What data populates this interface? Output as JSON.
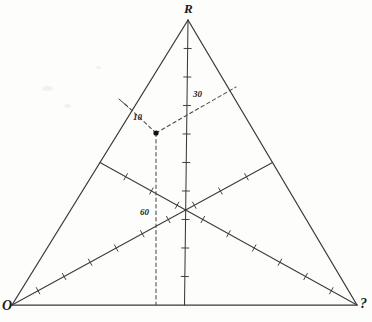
{
  "figure": {
    "type": "ternary-triangle-diagram",
    "background_color": "#fdfdfc",
    "line_color": "#3a3a3a",
    "dash_color": "#4a4a4a",
    "text_color": "#1a1a1a"
  },
  "vertices": {
    "top": {
      "label": "R",
      "x": 188,
      "y": 20,
      "label_x": 184,
      "label_y": 2
    },
    "bottom_left": {
      "label": "O",
      "x": 12,
      "y": 305,
      "label_x": 2,
      "label_y": 299
    },
    "bottom_right": {
      "label": "?",
      "x": 357,
      "y": 305,
      "label_x": 360,
      "label_y": 297
    }
  },
  "point": {
    "x": 156,
    "y": 133,
    "marker": "filled-circle"
  },
  "readings": [
    {
      "label": "10",
      "value": 10,
      "label_x": 133,
      "label_y": 113,
      "axis": "left-edge"
    },
    {
      "label": "30",
      "value": 30,
      "label_x": 193,
      "label_y": 90,
      "axis": "right-edge"
    },
    {
      "label": "60",
      "value": 60,
      "label_x": 140,
      "label_y": 208,
      "axis": "bottom-edge"
    }
  ],
  "dashed_lines": [
    {
      "name": "to-left-edge",
      "x1": 156,
      "y1": 133,
      "x2": 124,
      "y2": 103
    },
    {
      "name": "to-right-edge",
      "x1": 156,
      "y1": 133,
      "x2": 236,
      "y2": 87
    },
    {
      "name": "to-bottom-edge",
      "x1": 156,
      "y1": 133,
      "x2": 156,
      "y2": 305
    }
  ],
  "medians": [
    {
      "name": "median-from-top",
      "x1": 188,
      "y1": 20,
      "x2": 184.5,
      "y2": 305,
      "ticks": 9
    },
    {
      "name": "median-from-bottom-left",
      "x1": 12,
      "y1": 305,
      "x2": 272.5,
      "y2": 162.5,
      "ticks": 9
    },
    {
      "name": "median-from-bottom-right",
      "x1": 357,
      "y1": 305,
      "x2": 100,
      "y2": 162.5,
      "ticks": 9
    }
  ],
  "edges": [
    {
      "name": "edge-left-OR",
      "x1": 12,
      "y1": 305,
      "x2": 188,
      "y2": 20
    },
    {
      "name": "edge-right-R?",
      "x1": 188,
      "y1": 20,
      "x2": 357,
      "y2": 305
    },
    {
      "name": "edge-bottom-O?",
      "x1": 12,
      "y1": 305,
      "x2": 357,
      "y2": 305
    }
  ],
  "chart_data": {
    "type": "scatter",
    "title": "",
    "xlabel": "",
    "ylabel": "",
    "axes": [
      "R",
      "O",
      "?"
    ],
    "series": [
      {
        "name": "plotted-composition",
        "components": {
          "R": 10,
          "?": 30,
          "O": 60
        },
        "annotations": [
          "10",
          "30",
          "60"
        ]
      }
    ],
    "grid": false,
    "legend": "none"
  }
}
